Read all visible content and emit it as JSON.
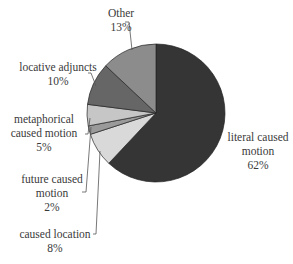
{
  "chart_data": {
    "type": "pie",
    "title": "",
    "start_angle_deg": 0,
    "direction": "clockwise",
    "slices": [
      {
        "label": "literal caused motion",
        "label_lines": [
          "literal caused",
          "motion"
        ],
        "value": 62,
        "pct_label": "62%",
        "color": "#353535"
      },
      {
        "label": "caused location",
        "label_lines": [
          "caused location"
        ],
        "value": 8,
        "pct_label": "8%",
        "color": "#d9d9d9"
      },
      {
        "label": "future caused motion",
        "label_lines": [
          "future caused",
          "motion"
        ],
        "value": 2,
        "pct_label": "2%",
        "color": "#9a9a9a"
      },
      {
        "label": "metaphorical caused motion",
        "label_lines": [
          "metaphorical",
          "caused motion"
        ],
        "value": 5,
        "pct_label": "5%",
        "color": "#c6c6c6"
      },
      {
        "label": "locative adjuncts",
        "label_lines": [
          "locative adjuncts"
        ],
        "value": 10,
        "pct_label": "10%",
        "color": "#666666"
      },
      {
        "label": "Other",
        "label_lines": [
          "Other"
        ],
        "value": 13,
        "pct_label": "13%",
        "color": "#8c8c8c"
      }
    ],
    "legend": "none (direct labels with leader lines)"
  },
  "labels": {
    "literal": {
      "line1": "literal caused",
      "line2": "motion",
      "pct": "62%"
    },
    "caused_location": {
      "line1": "caused location",
      "pct": "8%"
    },
    "future": {
      "line1": "future caused",
      "line2": "motion",
      "pct": "2%"
    },
    "metaphorical": {
      "line1": "metaphorical",
      "line2": "caused motion",
      "pct": "5%"
    },
    "locative": {
      "line1": "locative adjuncts",
      "pct": "10%"
    },
    "other": {
      "line1": "Other",
      "pct": "13%"
    }
  }
}
